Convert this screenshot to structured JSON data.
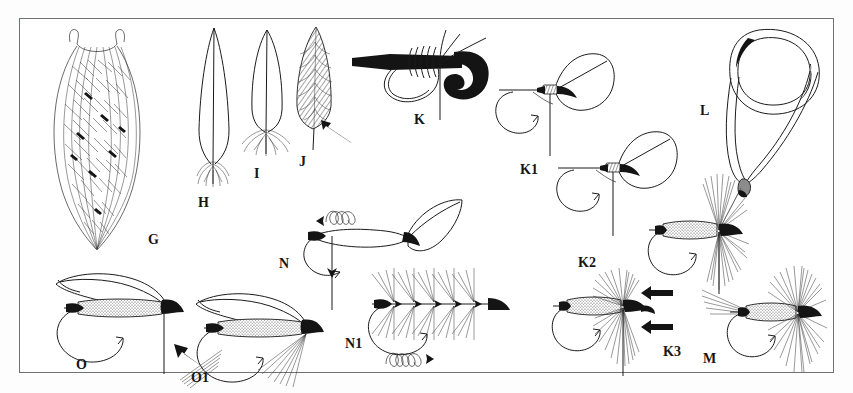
{
  "plate": {
    "title": "Fly tying illustration plate",
    "description": "Black and white line-art instructional plate showing feather preparation and wet/dry fly wing and hackle tying steps.",
    "background_color": "#ffffff",
    "border_color": "#6f7275",
    "ink_color": "#1b1b1b",
    "width": 853,
    "height": 393
  },
  "figures": [
    {
      "id": "G",
      "label": "G",
      "name": "feather-barb-bundle",
      "caption_x": 148,
      "caption_y": 233,
      "description": "Large bundle of splayed feather barbs / marabou style plume"
    },
    {
      "id": "H",
      "label": "H",
      "name": "stripped-quill-feather",
      "caption_x": 198,
      "caption_y": 196,
      "description": "Long narrow quill feather slip with fluff stripped at the base"
    },
    {
      "id": "I",
      "label": "I",
      "name": "rounded-tip-feather",
      "caption_x": 254,
      "caption_y": 167,
      "description": "Shorter rounded feather with webby base fibres"
    },
    {
      "id": "J",
      "label": "J",
      "name": "shaded-feather-with-arrow",
      "caption_x": 299,
      "caption_y": 155,
      "description": "Shaded hatched feather with a bold arrow pointing to the stem"
    },
    {
      "id": "K",
      "label": "K",
      "name": "thread-loop-on-shank",
      "caption_x": 414,
      "caption_y": 113,
      "description": "Close-up of thread wraps and loop secured on the hook shank"
    },
    {
      "id": "K1",
      "label": "K1",
      "name": "wing-tied-in-step-1",
      "caption_x": 520,
      "caption_y": 163,
      "description": "Hook with single wing quill tied in at the head"
    },
    {
      "id": "K2",
      "label": "K2",
      "name": "wing-tied-in-step-2",
      "caption_x": 578,
      "caption_y": 256,
      "description": "Hook with wing set and thread tension shown"
    },
    {
      "id": "K3",
      "label": "K3",
      "name": "hackled-wet-fly",
      "caption_x": 663,
      "caption_y": 345,
      "description": "Finished hackled fly with two bold arrows indicating hackle direction"
    },
    {
      "id": "L",
      "label": "L",
      "name": "thread-loop-lasso",
      "caption_x": 700,
      "caption_y": 104,
      "description": "Large open thread loop / lasso used to trap and lift fibres"
    },
    {
      "id": "M",
      "label": "M",
      "name": "finished-dry-fly",
      "caption_x": 703,
      "caption_y": 352,
      "description": "Finished dry fly with tail fibres, dubbed body and full hackle collar"
    },
    {
      "id": "N",
      "label": "N",
      "name": "hackle-tie-in-with-wraps",
      "caption_x": 279,
      "caption_y": 257,
      "description": "Hook shank with feather tied in and spiral thread-wrap arrows"
    },
    {
      "id": "N1",
      "label": "N1",
      "name": "palmered-hackle-wrapped",
      "caption_x": 345,
      "caption_y": 337,
      "description": "Feather palmered along the shank with spiral wrap arrows beneath"
    },
    {
      "id": "O",
      "label": "O",
      "name": "winged-wet-fly-before-hackle",
      "caption_x": 76,
      "caption_y": 358,
      "description": "Winged wet fly with dubbed body, arrow showing fibre bunch being added"
    },
    {
      "id": "O1",
      "label": "O1",
      "name": "winged-wet-fly-with-beard",
      "caption_x": 191,
      "caption_y": 371,
      "description": "Winged wet fly completed with beard hackle under the body"
    }
  ]
}
